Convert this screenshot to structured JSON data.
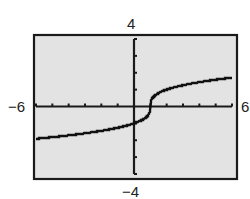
{
  "chart_data": {
    "type": "line",
    "title": "",
    "xlabel": "",
    "ylabel": "",
    "function": "y = cbrt(x - 1)",
    "xlim": [
      -6,
      6
    ],
    "ylim": [
      -4,
      4
    ],
    "xscale": 1,
    "yscale": 1,
    "grid": false,
    "legend": null,
    "window_labels": {
      "ymax": "4",
      "ymin": "−4",
      "xmin": "−6",
      "xmax": "6"
    },
    "series": [
      {
        "name": "f(x)",
        "x": [
          -6,
          -5,
          -4,
          -3,
          -2,
          -1,
          0,
          0.5,
          0.9,
          1,
          1.1,
          1.5,
          2,
          3,
          4,
          5,
          6
        ],
        "values": [
          -1.91,
          -1.82,
          -1.71,
          -1.59,
          -1.44,
          -1.26,
          -1.0,
          -0.79,
          -0.46,
          0,
          0.46,
          0.79,
          1.0,
          1.26,
          1.44,
          1.59,
          1.71
        ]
      }
    ]
  },
  "colors": {
    "frame_fill": "#e3e3e3",
    "frame_border": "#1a1a1a",
    "axis": "#1a1a1a",
    "curve": "#111111"
  }
}
